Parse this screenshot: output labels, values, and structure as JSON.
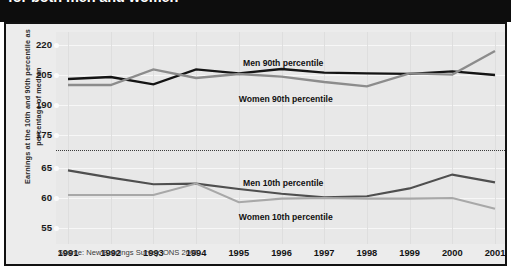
{
  "header": {
    "title": "for both men and women"
  },
  "chart_data": {
    "type": "line",
    "title": "for both men and women",
    "xlabel": "",
    "ylabel": "Earnings at the 10th and 90th percentile as percentage of median",
    "grid": true,
    "legend_position": "inline-labels",
    "broken_axis": true,
    "axis_note": "y-axis is broken between 175 and 65",
    "categories": [
      1991,
      1992,
      1993,
      1994,
      1995,
      1996,
      1997,
      1998,
      1999,
      2000,
      2001
    ],
    "yticks_upper": [
      175,
      190,
      205,
      220
    ],
    "yticks_lower": [
      55,
      60,
      65
    ],
    "ylim_upper": [
      175,
      220
    ],
    "ylim_lower": [
      55,
      65
    ],
    "series": [
      {
        "name": "Men 90th percentile",
        "color": "#141414",
        "panel": "upper",
        "values": [
          203.0,
          204.0,
          200.3,
          207.8,
          205.8,
          208.0,
          206.2,
          205.8,
          205.6,
          206.8,
          205.0
        ]
      },
      {
        "name": "Women 90th percentile",
        "color": "#8c8c8c",
        "panel": "upper",
        "values": [
          200.0,
          200.0,
          207.8,
          203.5,
          205.5,
          204.2,
          201.5,
          199.3,
          205.8,
          205.2,
          217.0
        ]
      },
      {
        "name": "Men 10th percentile",
        "color": "#4f4f4f",
        "panel": "lower",
        "values": [
          64.6,
          63.4,
          62.3,
          62.4,
          61.5,
          60.7,
          60.1,
          60.3,
          61.6,
          63.9,
          62.6
        ]
      },
      {
        "name": "Women 10th percentile",
        "color": "#a8a8a8",
        "panel": "lower",
        "values": [
          60.5,
          60.5,
          60.5,
          62.4,
          59.3,
          59.9,
          60.0,
          59.9,
          59.9,
          60.0,
          58.2
        ]
      }
    ],
    "annotations": [
      {
        "text": "Men 90th percentile",
        "x": 1995.1,
        "panel": "upper",
        "position": "above"
      },
      {
        "text": "Women 90th percentile",
        "x": 1995.0,
        "panel": "upper",
        "position": "below"
      },
      {
        "text": "Men 10th percentile",
        "x": 1995.1,
        "panel": "lower",
        "position": "above"
      },
      {
        "text": "Women 10th percentile",
        "x": 1995.0,
        "panel": "lower",
        "position": "below"
      }
    ],
    "source": "Source: New Earnings Survey, ONS 2002"
  },
  "labels": {
    "men_90": "Men 90th percentile",
    "women_90": "Women 90th percentile",
    "men_10": "Men 10th percentile",
    "women_10": "Women 10th percentile"
  },
  "ytick_texts": [
    "220",
    "205",
    "190",
    "175",
    "65",
    "60",
    "55"
  ],
  "xtick_texts": [
    "1991",
    "1992",
    "1993",
    "1994",
    "1995",
    "1996",
    "1997",
    "1998",
    "1999",
    "2000",
    "2001"
  ],
  "source": {
    "text": "Source: New Earnings Survey, ONS 2002"
  },
  "axis_title": {
    "text": "Earnings at the 10th and 90th percentile as percentage of median"
  }
}
